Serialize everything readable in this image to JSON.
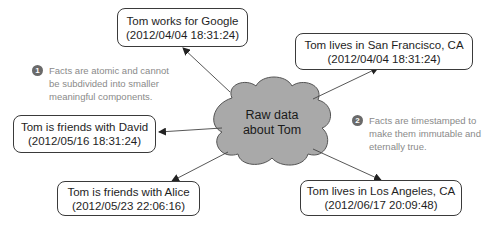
{
  "center": {
    "line1": "Raw data",
    "line2": "about Tom"
  },
  "facts": [
    {
      "id": "google",
      "text": "Tom works for Google",
      "timestamp": "(2012/04/04 18:31:24)"
    },
    {
      "id": "sf",
      "text": "Tom lives in San Francisco, CA",
      "timestamp": "(2012/04/04 18:31:24)"
    },
    {
      "id": "david",
      "text": "Tom is friends with David",
      "timestamp": "(2012/05/16 18:31:24)"
    },
    {
      "id": "alice",
      "text": "Tom is friends with Alice",
      "timestamp": "(2012/05/23 22:06:16)"
    },
    {
      "id": "la",
      "text": "Tom lives in Los Angeles, CA",
      "timestamp": "(2012/06/17 20:09:48)"
    }
  ],
  "notes": [
    {
      "number": "1",
      "lines": [
        "Facts are atomic and cannot",
        "be subdivided into smaller",
        "meaningful components."
      ]
    },
    {
      "number": "2",
      "lines": [
        "Facts are timestamped to",
        "make them immutable and",
        "eternally true."
      ]
    }
  ],
  "colors": {
    "cloud_fill": "#a9a9a9",
    "stroke": "#3a3a3a",
    "note_text": "#8a8a8a",
    "badge": "#6a6a6a"
  }
}
